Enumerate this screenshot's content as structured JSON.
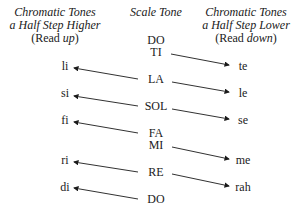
{
  "headers": {
    "left": {
      "line1": "Chromatic Tones",
      "line2": "a Half Step Higher",
      "line3_open": "(Read ",
      "line3_em": "up",
      "line3_close": ")"
    },
    "center": {
      "line1": "Scale Tone"
    },
    "right": {
      "line1": "Chromatic Tones",
      "line2": "a Half Step Lower",
      "line3_open": "(Read ",
      "line3_em": "down",
      "line3_close": ")"
    }
  },
  "scale_tones": [
    {
      "label": "DO",
      "y": 38
    },
    {
      "label": "TI",
      "y": 50
    },
    {
      "label": "LA",
      "y": 77
    },
    {
      "label": "SOL",
      "y": 104
    },
    {
      "label": "FA",
      "y": 131
    },
    {
      "label": "MI",
      "y": 143
    },
    {
      "label": "RE",
      "y": 170
    },
    {
      "label": "DO",
      "y": 197
    }
  ],
  "higher_tones": [
    {
      "label": "li",
      "y": 63
    },
    {
      "label": "si",
      "y": 90
    },
    {
      "label": "fi",
      "y": 117
    },
    {
      "label": "ri",
      "y": 157
    },
    {
      "label": "di",
      "y": 184
    }
  ],
  "lower_tones": [
    {
      "label": "te",
      "y": 63
    },
    {
      "label": "le",
      "y": 90
    },
    {
      "label": "se",
      "y": 117
    },
    {
      "label": "me",
      "y": 157
    },
    {
      "label": "rah",
      "y": 184
    }
  ]
}
